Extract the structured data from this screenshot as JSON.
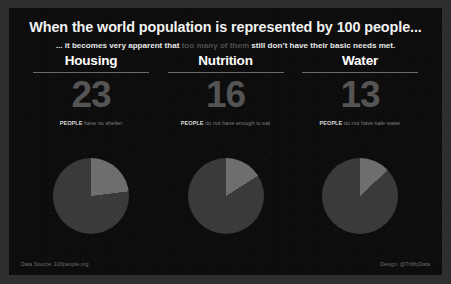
{
  "poster": {
    "headline": "When the world population is represented by 100 people...",
    "subhead": {
      "lead": "... it becomes very apparent that",
      "dim": "too many of them",
      "tail": "still don’t have their basic needs met."
    },
    "footer": {
      "source": "Data Source: 100people.org",
      "credit": "Design: @TriMyData"
    },
    "colors": {
      "background": "#2e2e2e",
      "panel": "#0d0d0d",
      "headline": "#f2f2f2",
      "dim_text": "#4f4f4f",
      "big_number": "#545454",
      "rule": "#6a6a6a",
      "pie_base": "#3a3a3a",
      "pie_highlight": "#6e6e6e"
    }
  },
  "columns": [
    {
      "title": "Housing",
      "value": "23",
      "caption_strong": "PEOPLE",
      "caption_rest": "have no shelter"
    },
    {
      "title": "Nutrition",
      "value": "16",
      "caption_strong": "PEOPLE",
      "caption_rest": "do not have enough to eat"
    },
    {
      "title": "Water",
      "value": "13",
      "caption_strong": "PEOPLE",
      "caption_rest": "do not have safe water"
    }
  ],
  "chart_data": {
    "type": "pie",
    "title": "When the world population is represented by 100 people...",
    "charts": [
      {
        "name": "Housing",
        "categories": [
          "have no shelter",
          "have shelter"
        ],
        "values": [
          23,
          77
        ],
        "unit": "people per 100",
        "start_angle_deg": 0,
        "direction": "clockwise",
        "colors": [
          "#6e6e6e",
          "#3a3a3a"
        ]
      },
      {
        "name": "Nutrition",
        "categories": [
          "do not have enough to eat",
          "have enough to eat"
        ],
        "values": [
          16,
          84
        ],
        "unit": "people per 100",
        "start_angle_deg": 0,
        "direction": "clockwise",
        "colors": [
          "#6e6e6e",
          "#3a3a3a"
        ]
      },
      {
        "name": "Water",
        "categories": [
          "do not have safe water",
          "have safe water"
        ],
        "values": [
          13,
          87
        ],
        "unit": "people per 100",
        "start_angle_deg": 0,
        "direction": "clockwise",
        "colors": [
          "#6e6e6e",
          "#3a3a3a"
        ]
      }
    ],
    "legend": "none",
    "grid": false
  }
}
